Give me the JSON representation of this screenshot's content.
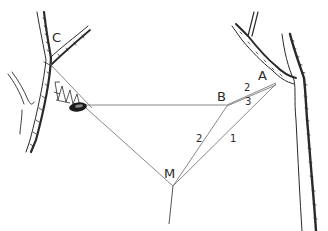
{
  "diagram": {
    "type": "spider-web-attachment-sketch",
    "style": "pen-and-ink line drawing",
    "colors": {
      "background": "#ffffff",
      "ink": "#2a2a2a",
      "thread": "#6a6a6a",
      "retreat": "#1a1a1a"
    },
    "labels": {
      "C": "C",
      "B": "B",
      "A": "A",
      "M": "M",
      "thread_2_upper": "2",
      "thread_3": "3",
      "thread_2_lower": "2",
      "thread_1": "1"
    },
    "nodes": [
      {
        "id": "C",
        "x": 57,
        "y": 66,
        "description": "attachment point on left tree fork"
      },
      {
        "id": "B",
        "x": 227,
        "y": 105,
        "description": "junction of horizontal thread and threads from A"
      },
      {
        "id": "A",
        "x": 275,
        "y": 83,
        "description": "attachment point on right tree branch"
      },
      {
        "id": "M",
        "x": 173,
        "y": 186,
        "description": "central hub where threads converge"
      }
    ],
    "edges": [
      {
        "from": "retreat",
        "to": "B",
        "label": ""
      },
      {
        "from": "B",
        "to": "A",
        "label": "2"
      },
      {
        "from": "B",
        "to": "A",
        "label": "3"
      },
      {
        "from": "retreat",
        "to": "M",
        "label": ""
      },
      {
        "from": "B",
        "to": "M",
        "label": "2"
      },
      {
        "from": "A",
        "to": "M",
        "label": "1"
      },
      {
        "from": "M",
        "to": "ground",
        "label": ""
      }
    ]
  }
}
